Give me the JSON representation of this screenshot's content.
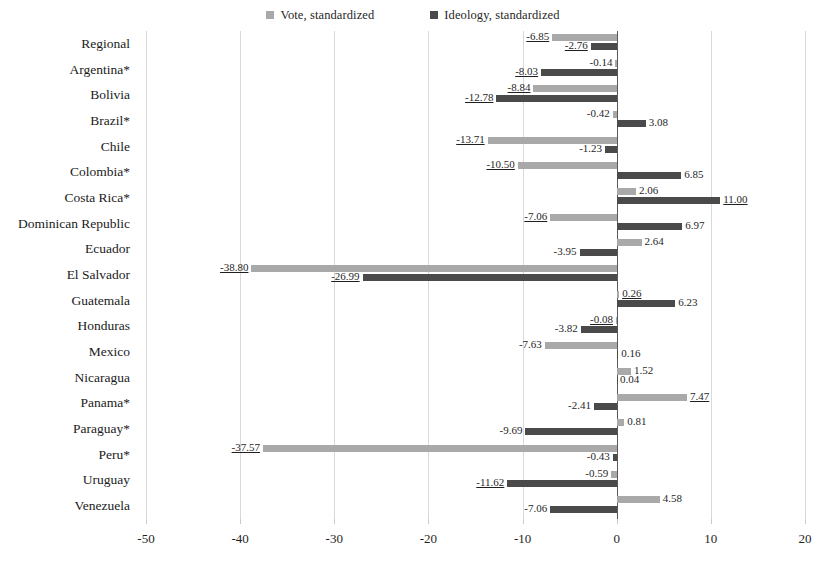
{
  "legend": {
    "items": [
      {
        "label": "Vote, standardized",
        "key": "vote",
        "color": "#a9a9a9"
      },
      {
        "label": "Ideology, standardized",
        "key": "ideology",
        "color": "#4a4a4a"
      }
    ]
  },
  "axis": {
    "ticks": [
      "-50",
      "-40",
      "-30",
      "-20",
      "-10",
      "0",
      "10",
      "20"
    ],
    "tick_values": [
      -50,
      -40,
      -30,
      -20,
      -10,
      0,
      10,
      20
    ],
    "min": -50,
    "max": 20
  },
  "chart_data": {
    "type": "bar",
    "orientation": "horizontal",
    "title": "",
    "xlabel": "",
    "ylabel": "",
    "xlim": [
      -50,
      20
    ],
    "grid": true,
    "legend_position": "top-center",
    "categories": [
      "Regional",
      "Argentina*",
      "Bolivia",
      "Brazil*",
      "Chile",
      "Colombia*",
      "Costa Rica*",
      "Dominican Republic",
      "Ecuador",
      "El Salvador",
      "Guatemala",
      "Honduras",
      "Mexico",
      "Nicaragua",
      "Panama*",
      "Paraguay*",
      "Peru*",
      "Uruguay",
      "Venezuela"
    ],
    "series": [
      {
        "name": "Vote, standardized",
        "color": "#a9a9a9",
        "values": [
          -6.85,
          -0.14,
          -8.84,
          -0.42,
          -13.71,
          -10.5,
          2.06,
          -7.06,
          2.64,
          -38.8,
          0.26,
          -0.08,
          -7.63,
          1.52,
          7.47,
          0.81,
          -37.57,
          -0.59,
          4.58
        ],
        "labels": [
          "-6.85",
          "-0.14",
          "-8.84",
          "-0.42",
          "-13.71",
          "-10.50",
          "2.06",
          "-7.06",
          "2.64",
          "-38.80",
          "0.26",
          "-0.08",
          "-7.63",
          "1.52",
          "7.47",
          "0.81",
          "-37.57",
          "-0.59",
          "4.58"
        ],
        "underlined": [
          true,
          false,
          true,
          false,
          true,
          true,
          false,
          true,
          false,
          true,
          true,
          true,
          false,
          false,
          true,
          false,
          true,
          false,
          false
        ]
      },
      {
        "name": "Ideology, standardized",
        "color": "#4a4a4a",
        "values": [
          -2.76,
          -8.03,
          -12.78,
          3.08,
          -1.23,
          6.85,
          11.0,
          6.97,
          -3.95,
          -26.99,
          6.23,
          -3.82,
          0.16,
          0.04,
          -2.41,
          -9.69,
          -0.43,
          -11.62,
          -7.06
        ],
        "labels": [
          "-2.76",
          "-8.03",
          "-12.78",
          "3.08",
          "-1.23",
          "6.85",
          "11.00",
          "6.97",
          "-3.95",
          "-26.99",
          "6.23",
          "-3.82",
          "0.16",
          "0.04",
          "-2.41",
          "-9.69",
          "-0.43",
          "-11.62",
          "-7.06"
        ],
        "underlined": [
          true,
          true,
          true,
          false,
          false,
          false,
          true,
          false,
          false,
          true,
          false,
          false,
          false,
          false,
          false,
          false,
          false,
          true,
          false
        ]
      }
    ]
  }
}
